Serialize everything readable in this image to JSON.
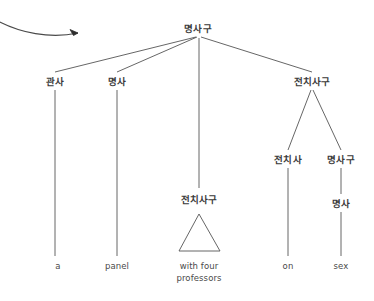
{
  "diagram": {
    "type": "syntax-tree",
    "title_visible": false,
    "background_color": "#ffffff",
    "line_color": "#555555",
    "text_color": "#3a3a3a",
    "annotation": {
      "name": "curved-arrow",
      "description": "curved arrow entering from left edge pointing right toward the tree"
    },
    "nodes": [
      {
        "id": "root",
        "label": "명사구",
        "x": 198,
        "y": 28,
        "kind": "nonterminal"
      },
      {
        "id": "det",
        "label": "관사",
        "x": 55,
        "y": 81,
        "kind": "nonterminal"
      },
      {
        "id": "noun1",
        "label": "명사",
        "x": 117,
        "y": 81,
        "kind": "nonterminal"
      },
      {
        "id": "pp_right",
        "label": "전치사구",
        "x": 312,
        "y": 81,
        "kind": "nonterminal"
      },
      {
        "id": "pp_mid",
        "label": "전치사구",
        "x": 199,
        "y": 199,
        "kind": "nonterminal"
      },
      {
        "id": "prep",
        "label": "전치사",
        "x": 288,
        "y": 159,
        "kind": "nonterminal"
      },
      {
        "id": "np_right",
        "label": "명사구",
        "x": 341,
        "y": 159,
        "kind": "nonterminal"
      },
      {
        "id": "noun2",
        "label": "명사",
        "x": 341,
        "y": 203,
        "kind": "nonterminal"
      },
      {
        "id": "word_a",
        "label": "a",
        "x": 58,
        "y": 266,
        "kind": "terminal"
      },
      {
        "id": "word_panel",
        "label": "panel",
        "x": 117,
        "y": 266,
        "kind": "terminal"
      },
      {
        "id": "word_with",
        "label": "with four\nprofessors",
        "x": 199,
        "y": 272,
        "kind": "terminal"
      },
      {
        "id": "word_on",
        "label": "on",
        "x": 288,
        "y": 266,
        "kind": "terminal"
      },
      {
        "id": "word_sex",
        "label": "sex",
        "x": 341,
        "y": 266,
        "kind": "terminal"
      }
    ],
    "terminal_lines": [
      "a",
      "panel",
      "with four professors",
      "on",
      "sex"
    ],
    "sentence": "a panel with four professors on sex",
    "labels": {
      "root": "명사구",
      "det": "관사",
      "noun1": "명사",
      "pp_right": "전치사구",
      "pp_mid": "전치사구",
      "prep": "전치사",
      "np_right": "명사구",
      "noun2": "명사",
      "word_a": "a",
      "word_panel": "panel",
      "word_with_line1": "with four",
      "word_with_line2": "professors",
      "word_on": "on",
      "word_sex": "sex"
    }
  }
}
